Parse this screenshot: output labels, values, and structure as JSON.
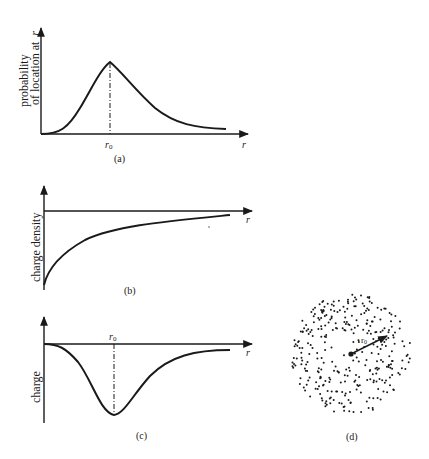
{
  "colors": {
    "ink": "#1a1a1a",
    "background": "#ffffff"
  },
  "panels": {
    "a": {
      "caption": "(a)",
      "ylabel_line1": "probability",
      "ylabel_line2": "of location at",
      "ylabel_var": "r",
      "xlabel": "r",
      "marker_label": "r",
      "marker_sub": "0"
    },
    "b": {
      "caption": "(b)",
      "ylabel": "charge density",
      "xlabel": "r"
    },
    "c": {
      "caption": "(c)",
      "ylabel": "charge",
      "xlabel": "r",
      "marker_label": "r",
      "marker_sub": "0"
    },
    "d": {
      "caption": "(d)",
      "radius_label": "r",
      "radius_sub": "0"
    }
  },
  "chart_data": [
    {
      "type": "line",
      "panel": "a",
      "title": "",
      "xlabel": "r",
      "ylabel": "probability of location at r",
      "description": "Radial probability rises from 0, peaks at r0, then decays asymptotically toward zero",
      "x": [
        0,
        0.25,
        0.5,
        0.75,
        1.0,
        1.5,
        2.0,
        2.5,
        3.0,
        3.5,
        4.0
      ],
      "values": [
        0,
        0.08,
        0.35,
        0.72,
        1.0,
        0.72,
        0.42,
        0.22,
        0.12,
        0.08,
        0.06
      ],
      "annotations": [
        "r0 at peak (dash-dot line)"
      ]
    },
    {
      "type": "line",
      "panel": "b",
      "title": "",
      "xlabel": "r",
      "ylabel": "charge density",
      "description": "Negative charge density, most negative near r=0, approaching 0 as r increases",
      "x": [
        0,
        0.25,
        0.5,
        1.0,
        1.5,
        2.0,
        2.5,
        3.0,
        3.5,
        4.0
      ],
      "values": [
        -1.0,
        -0.72,
        -0.58,
        -0.4,
        -0.28,
        -0.2,
        -0.14,
        -0.1,
        -0.07,
        -0.05
      ]
    },
    {
      "type": "line",
      "panel": "c",
      "title": "",
      "xlabel": "r",
      "ylabel": "charge",
      "description": "Charge in shell at r: zero at origin, minimum (most negative) at r0, returning toward zero",
      "x": [
        0,
        0.25,
        0.5,
        0.75,
        1.0,
        1.5,
        2.0,
        2.5,
        3.0,
        3.5,
        4.0
      ],
      "values": [
        0,
        -0.1,
        -0.4,
        -0.78,
        -1.0,
        -0.62,
        -0.34,
        -0.18,
        -0.1,
        -0.07,
        -0.05
      ],
      "annotations": [
        "r0 at minimum (dash-dot line)"
      ]
    }
  ]
}
